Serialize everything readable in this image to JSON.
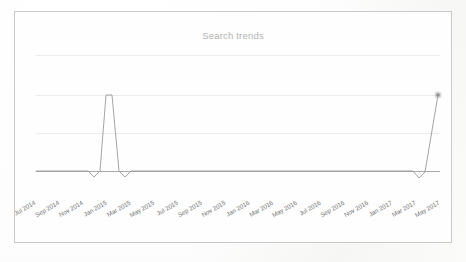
{
  "card": {
    "title": "Search trends"
  },
  "chart_data": {
    "type": "line",
    "title": "Search trends",
    "xlabel": "",
    "ylabel": "",
    "grid": true,
    "legend": false,
    "legend_position": "none",
    "ylim": [
      -0.18,
      1.35
    ],
    "yticks": [
      0,
      0.5,
      1.0,
      1.5
    ],
    "categories": [
      "Jul 2014",
      "Aug 2014",
      "Sep 2014",
      "Oct 2014",
      "Nov 2014",
      "Dec 2014",
      "Jan 2015",
      "Feb 2015",
      "Mar 2015",
      "Apr 2015",
      "May 2015",
      "Jun 2015",
      "Jul 2015",
      "Aug 2015",
      "Sep 2015",
      "Oct 2015",
      "Nov 2015",
      "Dec 2015",
      "Jan 2016",
      "Feb 2016",
      "Mar 2016",
      "Apr 2016",
      "May 2016",
      "Jun 2016",
      "Jul 2016",
      "Aug 2016",
      "Sep 2016",
      "Oct 2016",
      "Nov 2016",
      "Dec 2016",
      "Jan 2017",
      "Feb 2017",
      "Mar 2017",
      "Apr 2017",
      "May 2017"
    ],
    "tick_labels": [
      "Jul 2014",
      "Sep 2014",
      "Nov 2014",
      "Jan 2015",
      "Mar 2015",
      "May 2015",
      "Jul 2015",
      "Sep 2015",
      "Nov 2015",
      "Jan 2016",
      "Mar 2016",
      "May 2016",
      "Jul 2016",
      "Sep 2016",
      "Nov 2016",
      "Jan 2017",
      "Mar 2017",
      "May 2017"
    ],
    "tick_label_rotation": -30,
    "series": [
      {
        "name": "Search trends",
        "values": [
          0,
          0,
          0,
          0,
          0,
          -0.08,
          1.0,
          -0.08,
          0,
          0,
          0,
          0,
          0,
          0,
          0,
          0,
          0,
          0,
          0,
          0,
          0,
          0,
          0,
          0,
          0,
          0,
          0,
          0,
          0,
          0,
          0,
          0,
          -0.08,
          0.45,
          1.0
        ],
        "peak_points": [
          {
            "label": "Jan 2015",
            "value": 1.0
          },
          {
            "label": "May 2017",
            "value": 1.0
          }
        ],
        "end_marker": {
          "label": "May 2017",
          "value": 1.0
        }
      }
    ]
  }
}
